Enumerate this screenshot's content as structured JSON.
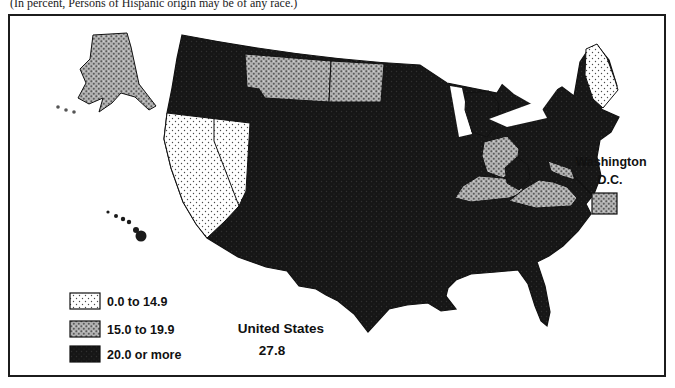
{
  "caption": "(In percent, Persons of Hispanic origin may be of any race.)",
  "legend": {
    "items": [
      {
        "label": "0.0 to 14.9",
        "pattern": "light-stipple",
        "fill": "#ffffff",
        "dot": "#4a4a4a"
      },
      {
        "label": "15.0 to 19.9",
        "pattern": "gray-stipple",
        "fill": "#b0b0b0",
        "dot": "#5a5a5a"
      },
      {
        "label": "20.0 or more",
        "pattern": "solid-black",
        "fill": "#161616"
      }
    ]
  },
  "summary": {
    "label": "United States",
    "value": "27.8"
  },
  "callout": {
    "line1": "Washington",
    "line2": "D.C."
  },
  "map_data": {
    "type": "choropleth",
    "unit": "percent",
    "us_value": 27.8,
    "classes": [
      {
        "range": "0.0 to 14.9",
        "regions": [
          "California",
          "Nevada",
          "Maine"
        ]
      },
      {
        "range": "15.0 to 19.9",
        "regions": [
          "Alaska",
          "Montana",
          "North Dakota",
          "Ohio",
          "Kentucky",
          "Virginia",
          "Maryland",
          "Washington D.C."
        ]
      },
      {
        "range": "20.0 or more",
        "regions": [
          "All other states",
          "Hawaii"
        ]
      }
    ]
  },
  "colors": {
    "black": "#161616",
    "gray": "#b0b0b0",
    "light": "#ffffff",
    "border": "#1c1c1c"
  }
}
